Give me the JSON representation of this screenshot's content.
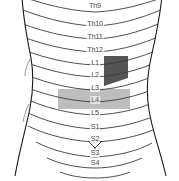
{
  "figure": {
    "kind": "dermatome-map",
    "view": "posterior torso",
    "background_color": "#ffffff",
    "outline_color": "#1a1a1a",
    "dermatome_line_color": "#3c3c3c",
    "levels": [
      {
        "id": "th9",
        "label": "Th9",
        "x": 95,
        "y": 6,
        "clipped": true,
        "on_dark": false
      },
      {
        "id": "th10",
        "label": "Th10",
        "x": 95,
        "y": 24,
        "clipped": false,
        "on_dark": false
      },
      {
        "id": "th11",
        "label": "Th11",
        "x": 95,
        "y": 37,
        "clipped": false,
        "on_dark": false
      },
      {
        "id": "th12",
        "label": "Th12",
        "x": 95,
        "y": 50,
        "clipped": false,
        "on_dark": false
      },
      {
        "id": "l1",
        "label": "L1",
        "x": 95,
        "y": 63,
        "clipped": false,
        "on_dark": false
      },
      {
        "id": "l2",
        "label": "L2",
        "x": 95,
        "y": 75,
        "clipped": false,
        "on_dark": false
      },
      {
        "id": "l3",
        "label": "L3",
        "x": 95,
        "y": 88,
        "clipped": false,
        "on_dark": false
      },
      {
        "id": "l4",
        "label": "L4",
        "x": 95,
        "y": 100,
        "clipped": false,
        "on_dark": true
      },
      {
        "id": "l5",
        "label": "L5",
        "x": 95,
        "y": 113,
        "clipped": false,
        "on_dark": false
      },
      {
        "id": "s1",
        "label": "S1",
        "x": 95,
        "y": 127,
        "clipped": false,
        "on_dark": false
      },
      {
        "id": "s2",
        "label": "S2",
        "x": 95,
        "y": 139,
        "clipped": false,
        "on_dark": false
      },
      {
        "id": "s3",
        "label": "S3",
        "x": 95,
        "y": 153,
        "clipped": false,
        "on_dark": false
      },
      {
        "id": "s4",
        "label": "S4",
        "x": 95,
        "y": 163,
        "clipped": false,
        "on_dark": false
      }
    ],
    "highlights": [
      {
        "id": "dark-band",
        "shape": "parallelogram",
        "color": "#545454",
        "covers": [
          "L1",
          "L2"
        ],
        "side": "right",
        "points": "104,56 128,56 128,78 104,86"
      },
      {
        "id": "light-band",
        "shape": "rectangle",
        "color": "#bdbdbd",
        "covers": [
          "L3",
          "L4",
          "L5"
        ],
        "side": "full-width",
        "x": 58,
        "y": 89,
        "width": 72,
        "height": 20
      }
    ],
    "markers": [
      {
        "id": "gluteal-cleft",
        "label": "",
        "x": 95,
        "y": 146
      }
    ],
    "caption": ""
  }
}
